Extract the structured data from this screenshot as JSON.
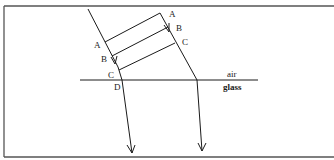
{
  "diagram": {
    "media": {
      "upper": "air",
      "lower": "glass"
    },
    "left_ray_labels": [
      "A",
      "B",
      "C",
      "D"
    ],
    "right_ray_labels": [
      "A",
      "B",
      "C"
    ],
    "colors": {
      "line": "#1a1a1a",
      "frame": "#555555",
      "background": "#ffffff"
    }
  }
}
